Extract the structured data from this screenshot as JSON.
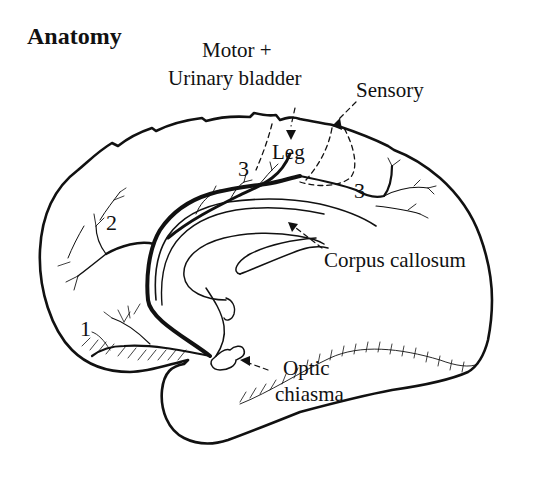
{
  "title": "Anatomy",
  "labels": {
    "motor": "Motor +",
    "urinary_bladder": "Urinary bladder",
    "sensory": "Sensory",
    "leg": "Leg",
    "corpus_callosum": "Corpus callosum",
    "optic": "Optic",
    "chiasma": "chiasma"
  },
  "branch_numbers": {
    "branch_1": "1",
    "branch_2": "2",
    "branch_3_left": "3",
    "branch_3_right": "3"
  },
  "colors": {
    "ink": "#111111",
    "background": "#ffffff"
  }
}
